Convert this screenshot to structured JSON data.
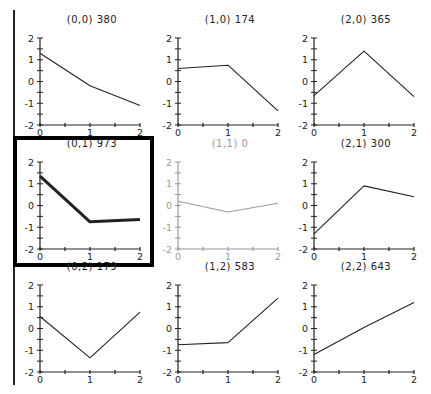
{
  "colors": {
    "axis": "#222222",
    "line": "#222222",
    "inactive": "#9a9a9a",
    "selected_border": "#000000",
    "background": "#ffffff"
  },
  "layout": {
    "columns_x0": [
      40,
      178,
      314
    ],
    "plot_width": 100,
    "rows_y_top": [
      38,
      162,
      285
    ],
    "plot_height": 87,
    "left_rule": {
      "x": 14,
      "y1": 10,
      "y2": 385
    },
    "selected_box": {
      "x": 15,
      "y": 138,
      "w": 137,
      "h": 127
    }
  },
  "chart_data": {
    "type": "line",
    "title": "",
    "layout_type": "small-multiples 3x3 grid",
    "xlabel": "",
    "ylabel": "",
    "x_ticks": [
      0,
      1,
      2
    ],
    "y_ticks": [
      2,
      1,
      0,
      -1,
      -2
    ],
    "xlim": [
      0,
      2
    ],
    "ylim": [
      -2,
      2
    ],
    "grid": false,
    "selected_panel": "(0,1)",
    "panels": [
      {
        "id": "(0,0)",
        "col": 0,
        "row": 0,
        "label": "(0,0)",
        "count": "380",
        "x": [
          0,
          1,
          2
        ],
        "y": [
          1.3,
          -0.2,
          -1.1
        ],
        "state": "normal"
      },
      {
        "id": "(1,0)",
        "col": 1,
        "row": 0,
        "label": "(1,0)",
        "count": "174",
        "x": [
          0,
          1,
          2
        ],
        "y": [
          0.6,
          0.75,
          -1.35
        ],
        "state": "normal"
      },
      {
        "id": "(2,0)",
        "col": 2,
        "row": 0,
        "label": "(2,0)",
        "count": "365",
        "x": [
          0,
          1,
          2
        ],
        "y": [
          -0.65,
          1.4,
          -0.7
        ],
        "state": "normal"
      },
      {
        "id": "(0,1)",
        "col": 0,
        "row": 1,
        "label": "(0,1)",
        "count": "973",
        "x": [
          0,
          1,
          2
        ],
        "y": [
          1.35,
          -0.75,
          -0.65
        ],
        "state": "selected"
      },
      {
        "id": "(1,1)",
        "col": 1,
        "row": 1,
        "label": "(1,1)",
        "count": "0",
        "x": [
          0,
          1,
          2
        ],
        "y": [
          0.2,
          -0.3,
          0.1
        ],
        "state": "inactive"
      },
      {
        "id": "(2,1)",
        "col": 2,
        "row": 1,
        "label": "(2,1)",
        "count": "300",
        "x": [
          0,
          1,
          2
        ],
        "y": [
          -1.3,
          0.9,
          0.4
        ],
        "state": "normal"
      },
      {
        "id": "(0,2)",
        "col": 0,
        "row": 2,
        "label": "(0,2)",
        "count": "179",
        "x": [
          0,
          1,
          2
        ],
        "y": [
          0.55,
          -1.35,
          0.75
        ],
        "state": "normal"
      },
      {
        "id": "(1,2)",
        "col": 1,
        "row": 2,
        "label": "(1,2)",
        "count": "583",
        "x": [
          0,
          1,
          2
        ],
        "y": [
          -0.75,
          -0.65,
          1.4
        ],
        "state": "normal"
      },
      {
        "id": "(2,2)",
        "col": 2,
        "row": 2,
        "label": "(2,2)",
        "count": "643",
        "x": [
          0,
          1,
          2
        ],
        "y": [
          -1.2,
          0.05,
          1.2
        ],
        "state": "normal"
      }
    ]
  }
}
